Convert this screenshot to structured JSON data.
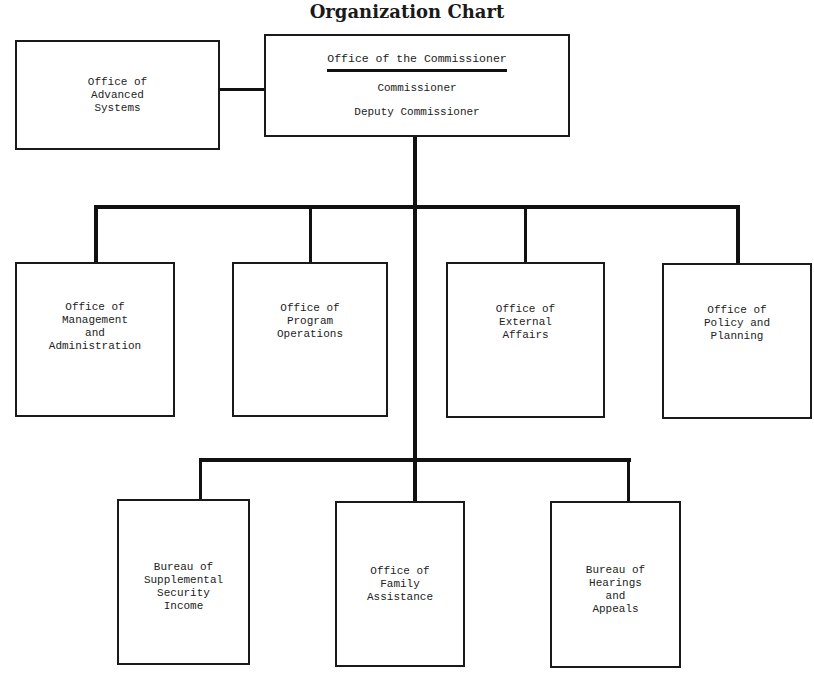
{
  "title": "Organization Chart",
  "commissioner": {
    "heading": "Office of the Commissioner",
    "roles": [
      "Commissioner",
      "Deputy Commissioner"
    ]
  },
  "staff_office": {
    "lines": [
      "Office of",
      "Advanced",
      "Systems"
    ]
  },
  "tier2": [
    {
      "lines": [
        "Office of",
        "Management",
        "and",
        "Administration"
      ]
    },
    {
      "lines": [
        "Office of",
        "Program",
        "Operations"
      ]
    },
    {
      "lines": [
        "Office of",
        "External",
        "Affairs"
      ]
    },
    {
      "lines": [
        "Office of",
        "Policy and",
        "Planning"
      ]
    }
  ],
  "tier3": [
    {
      "lines": [
        "Bureau of",
        "Supplemental",
        "Security",
        "Income"
      ]
    },
    {
      "lines": [
        "Office of",
        "Family",
        "Assistance"
      ]
    },
    {
      "lines": [
        "Bureau of",
        "Hearings",
        "and",
        "Appeals"
      ]
    }
  ]
}
